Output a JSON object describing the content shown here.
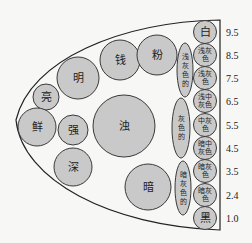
{
  "diagram": {
    "outline": "half-ellipse boundary",
    "main_circles": [
      {
        "label": "亮",
        "cx": 46,
        "cy": 97,
        "r": 13
      },
      {
        "label": "明",
        "cx": 78,
        "cy": 78,
        "r": 21
      },
      {
        "label": "钱",
        "cx": 120,
        "cy": 60,
        "r": 20
      },
      {
        "label": "粉",
        "cx": 157,
        "cy": 55,
        "r": 20
      },
      {
        "label": "鲜",
        "cx": 37,
        "cy": 127,
        "r": 19
      },
      {
        "label": "强",
        "cx": 73,
        "cy": 130,
        "r": 15
      },
      {
        "label": "深",
        "cx": 73,
        "cy": 167,
        "r": 19
      },
      {
        "label": "浊",
        "cx": 124,
        "cy": 126,
        "r": 31
      },
      {
        "label": "暗",
        "cx": 148,
        "cy": 187,
        "r": 23
      }
    ],
    "ellipses": [
      {
        "label": "浅灰色的",
        "chars": [
          "浅",
          "灰",
          "色",
          "的"
        ],
        "cx": 185,
        "cy": 70,
        "rx": 8,
        "ry": 27
      },
      {
        "label": "灰色的",
        "chars": [
          "灰",
          "色",
          "的"
        ],
        "cx": 181,
        "cy": 128,
        "rx": 9,
        "ry": 30
      },
      {
        "label": "暗灰色的",
        "chars": [
          "暗",
          "灰",
          "色",
          "的"
        ],
        "cx": 183,
        "cy": 188,
        "rx": 8,
        "ry": 27
      }
    ],
    "scale": [
      {
        "label": "白",
        "lines": [
          "白"
        ],
        "value": "9.5",
        "cy": 32
      },
      {
        "label": "浅灰色",
        "lines": [
          "浅灰",
          "色"
        ],
        "value": "8.5",
        "cy": 55
      },
      {
        "label": "浅灰色",
        "lines": [
          "浅灰",
          "色"
        ],
        "value": "7.5",
        "cy": 78
      },
      {
        "label": "浅中灰色",
        "lines": [
          "浅中",
          "灰色"
        ],
        "value": "6.5",
        "cy": 101
      },
      {
        "label": "中灰色",
        "lines": [
          "中灰",
          "色"
        ],
        "value": "5.5",
        "cy": 125
      },
      {
        "label": "暗中灰色",
        "lines": [
          "暗中",
          "灰色"
        ],
        "value": "4.5",
        "cy": 148
      },
      {
        "label": "暗灰色",
        "lines": [
          "暗灰",
          "色"
        ],
        "value": "3.5",
        "cy": 171
      },
      {
        "label": "暗灰色",
        "lines": [
          "暗灰",
          "色"
        ],
        "value": "2.4",
        "cy": 195
      },
      {
        "label": "黑",
        "lines": [
          "黑"
        ],
        "value": "1.0",
        "cy": 218
      }
    ]
  }
}
